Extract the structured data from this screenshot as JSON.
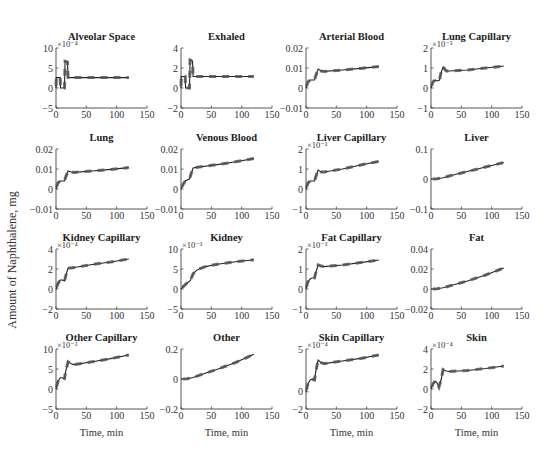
{
  "figure": {
    "ylabel": "Amount of Naphthalene, mg",
    "xlabel": "Time, min"
  },
  "chart_data": [
    {
      "type": "line",
      "title": "Alveolar Space",
      "xlabel": "",
      "ylabel": "",
      "xlim": [
        0,
        150
      ],
      "ylim": [
        -5,
        10
      ],
      "scale": "×10⁻⁴",
      "xticks": [
        "0",
        "50",
        "100",
        "150"
      ],
      "yticks": [
        "−5",
        "0",
        "5",
        "10"
      ],
      "ytick_vals": [
        -5,
        0,
        5,
        10
      ],
      "x": [
        0,
        0.5,
        7,
        7.5,
        14,
        15,
        19,
        20,
        120
      ],
      "y": [
        0,
        2.6,
        2.6,
        0,
        0,
        6.7,
        6.5,
        2.6,
        2.6
      ],
      "grid": false
    },
    {
      "type": "line",
      "title": "Exhaled",
      "xlabel": "",
      "ylabel": "",
      "xlim": [
        0,
        150
      ],
      "ylim": [
        -2,
        4
      ],
      "scale": "",
      "xticks": [
        "0",
        "50",
        "100",
        "150"
      ],
      "yticks": [
        "−2",
        "0",
        "2",
        "4"
      ],
      "ytick_vals": [
        -2,
        0,
        2,
        4
      ],
      "x": [
        0,
        0.5,
        7,
        7.5,
        14,
        15,
        19,
        20,
        120
      ],
      "y": [
        0,
        1.15,
        1.15,
        0,
        0,
        2.8,
        2.7,
        1.15,
        1.15
      ],
      "grid": false
    },
    {
      "type": "line",
      "title": "Arterial Blood",
      "xlabel": "",
      "ylabel": "",
      "xlim": [
        0,
        150
      ],
      "ylim": [
        -0.01,
        0.02
      ],
      "scale": "",
      "xticks": [
        "0",
        "50",
        "100",
        "150"
      ],
      "yticks": [
        "−0.01",
        "0",
        "0.01",
        "0.02"
      ],
      "ytick_vals": [
        -0.01,
        0,
        0.01,
        0.02
      ],
      "x": [
        0,
        3,
        7,
        10,
        14,
        16,
        20,
        25,
        30,
        60,
        90,
        120
      ],
      "y": [
        0,
        0.003,
        0.004,
        0.004,
        0.004,
        0.006,
        0.0095,
        0.0085,
        0.0083,
        0.009,
        0.0098,
        0.0107
      ],
      "grid": false
    },
    {
      "type": "line",
      "title": "Lung Capillary",
      "xlabel": "",
      "ylabel": "",
      "xlim": [
        0,
        150
      ],
      "ylim": [
        -1,
        2
      ],
      "scale": "×10⁻³",
      "xticks": [
        "0",
        "50",
        "100",
        "150"
      ],
      "yticks": [
        "−1",
        "0",
        "1",
        "2"
      ],
      "ytick_vals": [
        -1,
        0,
        1,
        2
      ],
      "x": [
        0,
        3,
        7,
        10,
        14,
        16,
        20,
        25,
        30,
        60,
        90,
        120
      ],
      "y": [
        0,
        0.3,
        0.4,
        0.35,
        0.4,
        0.7,
        1.05,
        0.85,
        0.85,
        0.9,
        1.0,
        1.1
      ],
      "grid": false
    },
    {
      "type": "line",
      "title": "Lung",
      "xlabel": "",
      "ylabel": "",
      "xlim": [
        0,
        150
      ],
      "ylim": [
        -0.01,
        0.02
      ],
      "scale": "",
      "xticks": [
        "0",
        "50",
        "100",
        "150"
      ],
      "yticks": [
        "−0.01",
        "0",
        "0.01",
        "0.02"
      ],
      "ytick_vals": [
        -0.01,
        0,
        0.01,
        0.02
      ],
      "x": [
        0,
        3,
        7,
        10,
        14,
        16,
        20,
        25,
        30,
        60,
        90,
        120
      ],
      "y": [
        0,
        0.003,
        0.004,
        0.004,
        0.004,
        0.006,
        0.009,
        0.0085,
        0.0083,
        0.009,
        0.0098,
        0.0107
      ],
      "grid": false
    },
    {
      "type": "line",
      "title": "Venous Blood",
      "xlabel": "",
      "ylabel": "",
      "xlim": [
        0,
        150
      ],
      "ylim": [
        -0.01,
        0.02
      ],
      "scale": "",
      "xticks": [
        "0",
        "50",
        "100",
        "150"
      ],
      "yticks": [
        "−0.01",
        "0",
        "0.01",
        "0.02"
      ],
      "ytick_vals": [
        -0.01,
        0,
        0.01,
        0.02
      ],
      "x": [
        0,
        3,
        7,
        10,
        14,
        16,
        20,
        25,
        30,
        60,
        90,
        120
      ],
      "y": [
        0,
        0.002,
        0.004,
        0.0045,
        0.005,
        0.007,
        0.0105,
        0.0108,
        0.011,
        0.0122,
        0.0136,
        0.0152
      ],
      "grid": false
    },
    {
      "type": "line",
      "title": "Liver Capillary",
      "xlabel": "",
      "ylabel": "",
      "xlim": [
        0,
        150
      ],
      "ylim": [
        -1,
        2
      ],
      "scale": "×10⁻³",
      "xticks": [
        "0",
        "50",
        "100",
        "150"
      ],
      "yticks": [
        "−1",
        "0",
        "1",
        "2"
      ],
      "ytick_vals": [
        -1,
        0,
        1,
        2
      ],
      "x": [
        0,
        3,
        7,
        10,
        14,
        16,
        20,
        25,
        30,
        60,
        90,
        120
      ],
      "y": [
        0,
        0.3,
        0.4,
        0.4,
        0.4,
        0.6,
        0.95,
        0.85,
        0.85,
        1.0,
        1.2,
        1.38
      ],
      "grid": false
    },
    {
      "type": "line",
      "title": "Liver",
      "xlabel": "",
      "ylabel": "",
      "xlim": [
        0,
        150
      ],
      "ylim": [
        -0.1,
        0.1
      ],
      "scale": "",
      "xticks": [
        "0",
        "50",
        "100",
        "150"
      ],
      "yticks": [
        "−0.1",
        "0",
        "0.1"
      ],
      "ytick_vals": [
        -0.1,
        0,
        0.1
      ],
      "x": [
        0,
        10,
        20,
        30,
        60,
        90,
        120
      ],
      "y": [
        0,
        0.001,
        0.004,
        0.01,
        0.025,
        0.04,
        0.055
      ],
      "grid": false
    },
    {
      "type": "line",
      "title": "Kidney Capillary",
      "xlabel": "",
      "ylabel": "",
      "xlim": [
        0,
        150
      ],
      "ylim": [
        -2,
        4
      ],
      "scale": "×10⁻⁴",
      "xticks": [
        "0",
        "50",
        "100",
        "150"
      ],
      "yticks": [
        "−2",
        "0",
        "2",
        "4"
      ],
      "ytick_vals": [
        -2,
        0,
        2,
        4
      ],
      "x": [
        0,
        3,
        7,
        10,
        14,
        16,
        20,
        25,
        30,
        60,
        90,
        120
      ],
      "y": [
        0,
        0.5,
        0.9,
        0.9,
        0.8,
        1.3,
        2.1,
        2.1,
        2.15,
        2.45,
        2.7,
        3.0
      ],
      "grid": false
    },
    {
      "type": "line",
      "title": "Kidney",
      "xlabel": "",
      "ylabel": "",
      "xlim": [
        0,
        150
      ],
      "ylim": [
        -5,
        10
      ],
      "scale": "×10⁻³",
      "xticks": [
        "0",
        "50",
        "100",
        "150"
      ],
      "yticks": [
        "−5",
        "0",
        "5",
        "10"
      ],
      "ytick_vals": [
        -5,
        0,
        5,
        10
      ],
      "x": [
        0,
        5,
        10,
        15,
        20,
        25,
        30,
        40,
        60,
        90,
        120
      ],
      "y": [
        0,
        0.8,
        1.5,
        2.0,
        3.8,
        4.6,
        5.0,
        5.6,
        6.2,
        6.8,
        7.3
      ],
      "grid": false
    },
    {
      "type": "line",
      "title": "Fat Capillary",
      "xlabel": "",
      "ylabel": "",
      "xlim": [
        0,
        150
      ],
      "ylim": [
        -1,
        2
      ],
      "scale": "×10⁻³",
      "xticks": [
        "0",
        "50",
        "100",
        "150"
      ],
      "yticks": [
        "−1",
        "0",
        "1",
        "2"
      ],
      "ytick_vals": [
        -1,
        0,
        1,
        2
      ],
      "x": [
        0,
        3,
        7,
        10,
        14,
        16,
        20,
        25,
        30,
        60,
        90,
        120
      ],
      "y": [
        0,
        0.35,
        0.5,
        0.55,
        0.55,
        0.8,
        1.2,
        1.15,
        1.12,
        1.2,
        1.32,
        1.45
      ],
      "grid": false
    },
    {
      "type": "line",
      "title": "Fat",
      "xlabel": "",
      "ylabel": "",
      "xlim": [
        0,
        150
      ],
      "ylim": [
        -0.02,
        0.04
      ],
      "scale": "",
      "xticks": [
        "0",
        "50",
        "100",
        "150"
      ],
      "yticks": [
        "−0.02",
        "0",
        "0.02",
        "0.04"
      ],
      "ytick_vals": [
        -0.02,
        0,
        0.02,
        0.04
      ],
      "x": [
        0,
        10,
        20,
        30,
        60,
        90,
        120
      ],
      "y": [
        0,
        0.0002,
        0.0012,
        0.003,
        0.008,
        0.014,
        0.021
      ],
      "grid": false
    },
    {
      "type": "line",
      "title": "Other Capillary",
      "xlabel": "Time, min",
      "ylabel": "",
      "xlim": [
        0,
        150
      ],
      "ylim": [
        -5,
        10
      ],
      "scale": "×10⁻³",
      "xticks": [
        "0",
        "50",
        "100",
        "150"
      ],
      "yticks": [
        "−5",
        "0",
        "5",
        "10"
      ],
      "ytick_vals": [
        -5,
        0,
        5,
        10
      ],
      "x": [
        0,
        3,
        7,
        10,
        14,
        16,
        20,
        25,
        30,
        60,
        90,
        120
      ],
      "y": [
        0,
        1.8,
        2.8,
        2.8,
        2.6,
        4.5,
        6.8,
        6.3,
        6.1,
        6.8,
        7.6,
        8.5
      ],
      "grid": false
    },
    {
      "type": "line",
      "title": "Other",
      "xlabel": "Time, min",
      "ylabel": "",
      "xlim": [
        0,
        150
      ],
      "ylim": [
        -0.2,
        0.2
      ],
      "scale": "",
      "xticks": [
        "0",
        "50",
        "100",
        "150"
      ],
      "yticks": [
        "−0.2",
        "0",
        "0.2"
      ],
      "ytick_vals": [
        -0.2,
        0,
        0.2
      ],
      "x": [
        0,
        10,
        20,
        30,
        60,
        90,
        120
      ],
      "y": [
        0,
        0.002,
        0.01,
        0.025,
        0.065,
        0.11,
        0.165
      ],
      "grid": false
    },
    {
      "type": "line",
      "title": "Skin Capillary",
      "xlabel": "Time, min",
      "ylabel": "",
      "xlim": [
        0,
        150
      ],
      "ylim": [
        -2,
        5
      ],
      "scale": "×10⁻⁴",
      "xticks": [
        "0",
        "50",
        "100",
        "150"
      ],
      "yticks": [
        "−2",
        "0",
        "5"
      ],
      "ytick_vals": [
        -2,
        0,
        5
      ],
      "x": [
        0,
        3,
        7,
        10,
        14,
        16,
        20,
        25,
        30,
        60,
        90,
        120
      ],
      "y": [
        0,
        0.9,
        1.4,
        1.5,
        1.4,
        2.3,
        3.7,
        3.4,
        3.3,
        3.6,
        3.9,
        4.3
      ],
      "grid": false
    },
    {
      "type": "line",
      "title": "Skin",
      "xlabel": "Time, min",
      "ylabel": "",
      "xlim": [
        0,
        150
      ],
      "ylim": [
        -2,
        4
      ],
      "scale": "×10⁻⁴",
      "xticks": [
        "0",
        "50",
        "100",
        "150"
      ],
      "yticks": [
        "−2",
        "0",
        "2",
        "4"
      ],
      "ytick_vals": [
        -2,
        0,
        2,
        4
      ],
      "x": [
        0,
        3,
        7,
        10,
        13,
        15,
        17,
        20,
        25,
        30,
        60,
        90,
        120
      ],
      "y": [
        0,
        0.5,
        0.8,
        0.6,
        0.2,
        0.6,
        1.0,
        1.95,
        1.8,
        1.75,
        1.85,
        2.05,
        2.3
      ],
      "grid": false
    }
  ]
}
